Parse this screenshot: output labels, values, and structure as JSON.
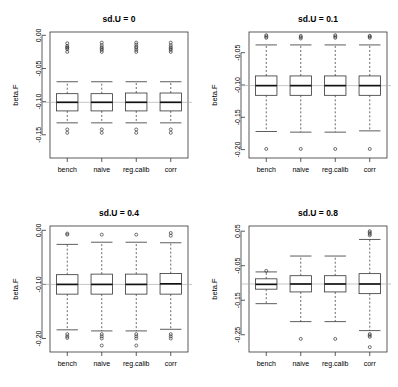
{
  "figure": {
    "title": "",
    "width": 398,
    "height": 387,
    "layout": "2x2 panel grid of boxplots",
    "background": "#ffffff",
    "accent_colors": {
      "box_stroke": "#333333",
      "median": "#111111",
      "reference_line": "#aaaaaa",
      "background": "#ffffff"
    }
  },
  "chart_data": [
    {
      "type": "box",
      "panel_id": "sd-u-0",
      "title": "sd.U =  0",
      "xlabel": "",
      "ylabel": "beta.F",
      "categories": [
        "bench",
        "naive",
        "reg.calib",
        "corr"
      ],
      "ylim": [
        -0.185,
        0.005
      ],
      "yticks": [
        0.0,
        -0.05,
        -0.1,
        -0.15
      ],
      "ytick_labels": [
        "0.00",
        "-0.05",
        "-0.10",
        "-0.15"
      ],
      "reference_line": -0.101,
      "grid": false,
      "legend": "none",
      "boxes": [
        {
          "category": "bench",
          "min": -0.132,
          "q1": -0.114,
          "median": -0.101,
          "q3": -0.088,
          "max": -0.07,
          "outliers": [
            -0.025,
            -0.021,
            -0.019,
            -0.018,
            -0.016,
            -0.012,
            -0.142,
            -0.147
          ]
        },
        {
          "category": "naive",
          "min": -0.132,
          "q1": -0.114,
          "median": -0.101,
          "q3": -0.088,
          "max": -0.07,
          "outliers": [
            -0.025,
            -0.022,
            -0.02,
            -0.018,
            -0.015,
            -0.011,
            -0.142,
            -0.147
          ]
        },
        {
          "category": "reg.calib",
          "min": -0.132,
          "q1": -0.114,
          "median": -0.101,
          "q3": -0.087,
          "max": -0.07,
          "outliers": [
            -0.025,
            -0.022,
            -0.019,
            -0.017,
            -0.014,
            -0.011,
            -0.142,
            -0.147
          ]
        },
        {
          "category": "corr",
          "min": -0.132,
          "q1": -0.114,
          "median": -0.101,
          "q3": -0.087,
          "max": -0.07,
          "outliers": [
            -0.025,
            -0.022,
            -0.02,
            -0.018,
            -0.015,
            -0.011,
            -0.142,
            -0.147
          ]
        }
      ]
    },
    {
      "type": "box",
      "panel_id": "sd-u-0-1",
      "title": "sd.U =  0.1",
      "xlabel": "",
      "ylabel": "beta.F",
      "categories": [
        "bench",
        "naive",
        "reg.calib",
        "corr"
      ],
      "ylim": [
        -0.213,
        -0.018
      ],
      "yticks": [
        -0.05,
        -0.1,
        -0.15,
        -0.2
      ],
      "ytick_labels": [
        "-0.05",
        "-0.10",
        "-0.15",
        "-0.20"
      ],
      "reference_line": -0.101,
      "grid": false,
      "legend": "none",
      "boxes": [
        {
          "category": "bench",
          "min": -0.172,
          "q1": -0.116,
          "median": -0.101,
          "q3": -0.086,
          "max": -0.038,
          "outliers": [
            -0.027,
            -0.025,
            -0.023,
            -0.199
          ]
        },
        {
          "category": "naive",
          "min": -0.173,
          "q1": -0.116,
          "median": -0.101,
          "q3": -0.086,
          "max": -0.038,
          "outliers": [
            -0.028,
            -0.026,
            -0.024,
            -0.199
          ]
        },
        {
          "category": "reg.calib",
          "min": -0.173,
          "q1": -0.116,
          "median": -0.101,
          "q3": -0.086,
          "max": -0.038,
          "outliers": [
            -0.027,
            -0.025,
            -0.023,
            -0.199
          ]
        },
        {
          "category": "corr",
          "min": -0.171,
          "q1": -0.116,
          "median": -0.101,
          "q3": -0.086,
          "max": -0.038,
          "outliers": [
            -0.027,
            -0.025,
            -0.024,
            -0.199
          ]
        }
      ]
    },
    {
      "type": "box",
      "panel_id": "sd-u-0-4",
      "title": "sd.U =  0.4",
      "xlabel": "",
      "ylabel": "beta.F",
      "categories": [
        "bench",
        "naive",
        "reg.calib",
        "corr"
      ],
      "ylim": [
        -0.225,
        0.008
      ],
      "yticks": [
        0.0,
        -0.1,
        -0.2
      ],
      "ytick_labels": [
        "0.00",
        "-0.10",
        "-0.20"
      ],
      "reference_line": -0.1,
      "grid": false,
      "legend": "none",
      "boxes": [
        {
          "category": "bench",
          "min": -0.184,
          "q1": -0.118,
          "median": -0.1,
          "q3": -0.082,
          "max": -0.026,
          "outliers": [
            -0.008,
            -0.006,
            -0.192,
            -0.196,
            -0.199
          ]
        },
        {
          "category": "naive",
          "min": -0.186,
          "q1": -0.118,
          "median": -0.1,
          "q3": -0.081,
          "max": -0.022,
          "outliers": [
            -0.008,
            -0.192,
            -0.196,
            -0.2,
            -0.213
          ]
        },
        {
          "category": "reg.calib",
          "min": -0.186,
          "q1": -0.118,
          "median": -0.1,
          "q3": -0.081,
          "max": -0.022,
          "outliers": [
            -0.008,
            -0.192,
            -0.196,
            -0.2,
            -0.213
          ]
        },
        {
          "category": "corr",
          "min": -0.183,
          "q1": -0.118,
          "median": -0.099,
          "q3": -0.08,
          "max": -0.023,
          "outliers": [
            -0.005,
            -0.01,
            -0.192,
            -0.196,
            -0.2
          ]
        }
      ]
    },
    {
      "type": "box",
      "panel_id": "sd-u-0-8",
      "title": "sd.U =  0.8",
      "xlabel": "",
      "ylabel": "beta.F",
      "categories": [
        "bench",
        "naive",
        "reg.calib",
        "corr"
      ],
      "ylim": [
        -0.3,
        0.065
      ],
      "yticks": [
        0.05,
        -0.05,
        -0.15,
        -0.25
      ],
      "ytick_labels": [
        "0.05",
        "-0.05",
        "-0.15",
        "-0.25"
      ],
      "reference_line": -0.103,
      "grid": false,
      "legend": "none",
      "boxes": [
        {
          "category": "bench",
          "min": -0.16,
          "q1": -0.118,
          "median": -0.104,
          "q3": -0.088,
          "max": -0.068,
          "outliers": [
            -0.065
          ]
        },
        {
          "category": "naive",
          "min": -0.212,
          "q1": -0.126,
          "median": -0.103,
          "q3": -0.079,
          "max": -0.022,
          "outliers": [
            -0.262
          ]
        },
        {
          "category": "reg.calib",
          "min": -0.212,
          "q1": -0.126,
          "median": -0.103,
          "q3": -0.079,
          "max": -0.022,
          "outliers": [
            -0.262
          ]
        },
        {
          "category": "corr",
          "min": -0.238,
          "q1": -0.131,
          "median": -0.103,
          "q3": -0.073,
          "max": 0.026,
          "outliers": [
            0.042,
            0.046,
            0.05,
            0.038,
            -0.248,
            -0.252,
            -0.256,
            -0.286
          ]
        }
      ]
    }
  ]
}
